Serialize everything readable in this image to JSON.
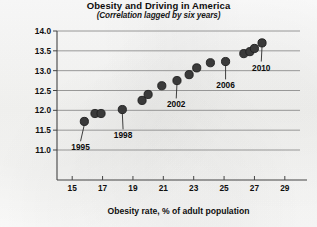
{
  "chart_data": {
    "type": "scatter",
    "title": "Obesity and Driving in America",
    "subtitle": "(Correlation lagged by six years)",
    "xlabel": "Obesity rate, % of adult population",
    "ylabel": "Vehicle miles travelled per driver",
    "xlim": [
      14,
      30
    ],
    "ylim": [
      10.75,
      14.0
    ],
    "xticks": [
      15,
      17,
      19,
      21,
      23,
      25,
      27,
      29
    ],
    "yticks": [
      "11.0",
      "11.5",
      "12.0",
      "12.5",
      "13.0",
      "13.5",
      "14.0"
    ],
    "grid": true,
    "legend": "none",
    "marker_color": "#3a3a3a",
    "points": [
      {
        "x": 15.8,
        "y": 11.72,
        "year": 1995
      },
      {
        "x": 16.5,
        "y": 11.92,
        "year": 1996
      },
      {
        "x": 16.9,
        "y": 11.92,
        "year": 1997
      },
      {
        "x": 18.3,
        "y": 12.02,
        "year": 1998
      },
      {
        "x": 19.6,
        "y": 12.25,
        "year": 1999
      },
      {
        "x": 20.0,
        "y": 12.4,
        "year": 2000
      },
      {
        "x": 20.9,
        "y": 12.62,
        "year": 2001
      },
      {
        "x": 21.9,
        "y": 12.75,
        "year": 2002
      },
      {
        "x": 22.7,
        "y": 12.9,
        "year": 2003
      },
      {
        "x": 23.2,
        "y": 13.07,
        "year": 2004
      },
      {
        "x": 24.1,
        "y": 13.2,
        "year": 2005
      },
      {
        "x": 25.1,
        "y": 13.23,
        "year": 2006
      },
      {
        "x": 26.3,
        "y": 13.43,
        "year": 2007
      },
      {
        "x": 26.7,
        "y": 13.48,
        "year": 2008
      },
      {
        "x": 27.0,
        "y": 13.56,
        "year": 2009
      },
      {
        "x": 27.5,
        "y": 13.7,
        "year": 2010
      }
    ],
    "annotations": [
      {
        "label": "1995",
        "point_index": 0
      },
      {
        "label": "1998",
        "point_index": 3
      },
      {
        "label": "2002",
        "point_index": 7
      },
      {
        "label": "2006",
        "point_index": 11
      },
      {
        "label": "2010",
        "point_index": 15
      }
    ]
  }
}
